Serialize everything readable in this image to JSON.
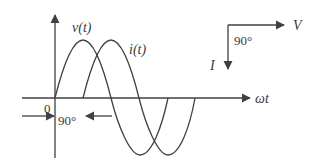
{
  "diagram": {
    "labels": {
      "voltage_curve": "v(t)",
      "current_curve": "i(t)",
      "origin": "0",
      "phase_shift": "90°",
      "x_axis": "ωt",
      "phasor_voltage": "V",
      "phasor_current": "I",
      "phasor_angle": "90°"
    },
    "colors": {
      "stroke": "#404040",
      "text": "#3a3a3a",
      "background": "#ffffff"
    }
  }
}
